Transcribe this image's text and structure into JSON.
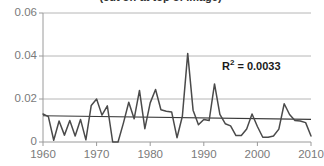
{
  "chart_data": {
    "type": "line",
    "title": "(cut off at top of image)",
    "xlabel": "",
    "ylabel": "",
    "xlim": [
      1960,
      2010
    ],
    "ylim": [
      0,
      0.06
    ],
    "grid": true,
    "legend_position": "none",
    "y_ticks": [
      "0",
      "0.02",
      "0.04",
      "0.06"
    ],
    "y_tick_values": [
      0,
      0.02,
      0.04,
      0.06
    ],
    "x_ticks": [
      "1960",
      "1970",
      "1980",
      "1990",
      "2000",
      "2010"
    ],
    "x_tick_values": [
      1960,
      1970,
      1980,
      1990,
      2000,
      2010
    ],
    "annotations": [
      {
        "name": "r-squared",
        "text_prefix": "R",
        "text_sup": "2",
        "text_suffix": " = 0.0033",
        "value": 0.0033
      }
    ],
    "series": [
      {
        "name": "data",
        "color": "#4a4a4a",
        "x": [
          1960,
          1961,
          1962,
          1963,
          1964,
          1965,
          1966,
          1967,
          1968,
          1969,
          1970,
          1971,
          1972,
          1973,
          1974,
          1975,
          1976,
          1977,
          1978,
          1979,
          1980,
          1981,
          1982,
          1983,
          1984,
          1985,
          1986,
          1987,
          1988,
          1989,
          1990,
          1991,
          1992,
          1993,
          1994,
          1995,
          1996,
          1997,
          1998,
          1999,
          2000,
          2001,
          2002,
          2003,
          2004,
          2005,
          2006,
          2007,
          2008,
          2009,
          2010
        ],
        "values": [
          0.013,
          0.0118,
          0.0008,
          0.0098,
          0.0032,
          0.01,
          0.0028,
          0.0105,
          0.001,
          0.017,
          0.02,
          0.0125,
          0.0168,
          0.0,
          0.0,
          0.0088,
          0.0185,
          0.0108,
          0.024,
          0.0062,
          0.0182,
          0.0244,
          0.015,
          0.0143,
          0.014,
          0.002,
          0.012,
          0.0412,
          0.0148,
          0.008,
          0.0105,
          0.01,
          0.027,
          0.0128,
          0.0085,
          0.0075,
          0.003,
          0.003,
          0.006,
          0.013,
          0.0072,
          0.0022,
          0.0022,
          0.0028,
          0.006,
          0.0178,
          0.0128,
          0.01,
          0.0098,
          0.009,
          0.0028
        ]
      }
    ],
    "trendline": {
      "name": "linear-trend",
      "color": "#3a3a3a",
      "x": [
        1960,
        2010
      ],
      "values": [
        0.0122,
        0.0105
      ]
    }
  }
}
